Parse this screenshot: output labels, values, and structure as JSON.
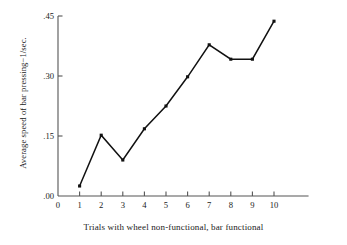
{
  "chart_data": {
    "type": "line",
    "title": "",
    "xlabel": "Trials with wheel non-functional, bar functional",
    "ylabel": "Average speed of bar pressing−1/sec.",
    "x": [
      1,
      2,
      3,
      4,
      5,
      6,
      7,
      8,
      9,
      10
    ],
    "categories": [
      "1",
      "2",
      "3",
      "4",
      "5",
      "6",
      "7",
      "8",
      "9",
      "10"
    ],
    "values": [
      0.025,
      0.152,
      0.09,
      0.168,
      0.225,
      0.298,
      0.378,
      0.342,
      0.342,
      0.437
    ],
    "series": [
      {
        "name": "Average speed of bar pressing",
        "values": [
          0.025,
          0.152,
          0.09,
          0.168,
          0.225,
          0.298,
          0.378,
          0.342,
          0.342,
          0.437
        ]
      }
    ],
    "xlim": [
      0,
      11.6
    ],
    "ylim": [
      0.0,
      0.45
    ],
    "xticks": [
      0,
      1,
      2,
      3,
      4,
      5,
      6,
      7,
      8,
      9,
      10
    ],
    "xtick_labels": [
      "0",
      "1",
      "2",
      "3",
      "4",
      "5",
      "6",
      "7",
      "8",
      "9",
      "10"
    ],
    "yticks": [
      0.0,
      0.15,
      0.3,
      0.45
    ],
    "ytick_labels": [
      ".00",
      ".15",
      ".30",
      ".45"
    ],
    "grid": false,
    "legend": "none",
    "line_color": "#111111",
    "marker": "filled-square",
    "marker_color": "#111111",
    "axis_color": "#555555",
    "background_color": "#ffffff"
  }
}
